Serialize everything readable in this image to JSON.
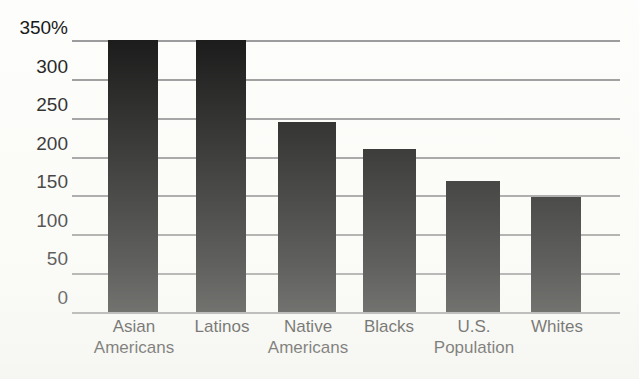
{
  "chart_data": {
    "type": "bar",
    "title": "",
    "subtitle": "",
    "xlabel": "",
    "ylabel": "",
    "categories": [
      "Asian Americans",
      "Latinos",
      "Native Americans",
      "Blacks",
      "U.S. Population",
      "Whites"
    ],
    "category_lines": [
      [
        "Asian",
        "Americans"
      ],
      [
        "Latinos",
        ""
      ],
      [
        "Native",
        "Americans"
      ],
      [
        "Blacks",
        ""
      ],
      [
        "U.S.",
        "Population"
      ],
      [
        "Whites",
        ""
      ]
    ],
    "values": [
      350,
      350,
      245,
      210,
      168,
      148
    ],
    "ylim": [
      0,
      350
    ],
    "ytick_values": [
      350,
      300,
      250,
      200,
      150,
      100,
      50,
      0
    ],
    "ytick_labels": [
      "350%",
      "300",
      "250",
      "200",
      "150",
      "100",
      "50",
      "0"
    ],
    "grid": true,
    "legend": "none",
    "bar_color": "#101010",
    "gridline_color": "#8e8e90",
    "background_color": "#fdfdfb",
    "units": "percent"
  }
}
